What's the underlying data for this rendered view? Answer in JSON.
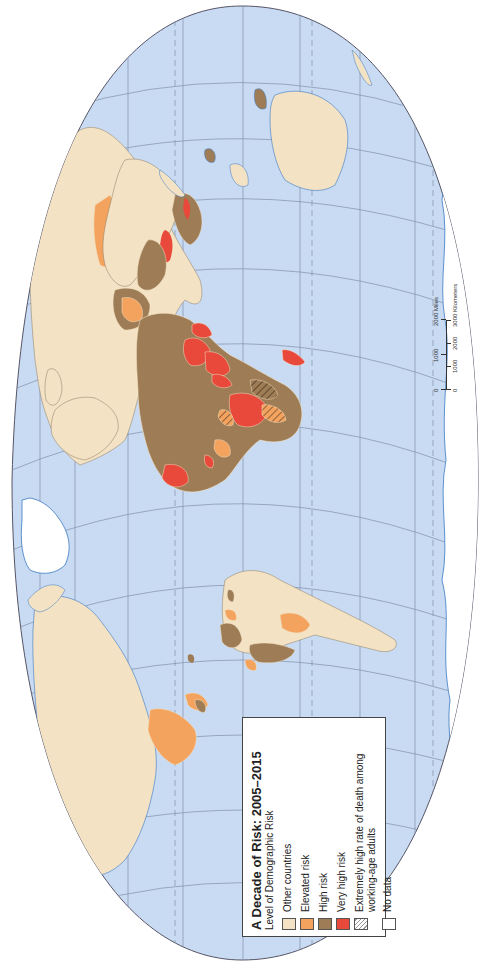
{
  "map": {
    "title": "A Decade of Risk:  2005–2015",
    "subtitle": "Level of Demographic Risk",
    "orientation": "rotated 90° counter-clockwise (north points left)",
    "colors": {
      "ocean": "#c9dbf3",
      "other": "#f3e2c4",
      "elevated": "#f3a35e",
      "high": "#9e7c55",
      "very_high": "#e8493a",
      "no_data": "#ffffff",
      "graticule": "#7f8fa8",
      "coast": "#3a78c2"
    }
  },
  "legend": {
    "title": "A Decade of Risk:  2005–2015",
    "subtitle": "Level of Demographic Risk",
    "items": [
      {
        "label": "Other countries",
        "color": "#f3e2c4"
      },
      {
        "label": "Elevated risk",
        "color": "#f3a35e"
      },
      {
        "label": "High risk",
        "color": "#9e7c55"
      },
      {
        "label": "Very high risk",
        "color": "#e8493a"
      },
      {
        "label": "Extremely high rate of death among working-age adults",
        "color": "hatch"
      },
      {
        "label": "No data",
        "color": "#ffffff"
      }
    ]
  },
  "scale": {
    "miles_labels": [
      "0",
      "1000",
      "2000 Miles"
    ],
    "km_labels": [
      "0",
      "1000",
      "2000",
      "3000 Kilometers"
    ]
  }
}
